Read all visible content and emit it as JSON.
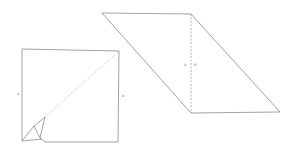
{
  "diagram": {
    "colors": {
      "stroke": "#8a8a8a",
      "dashed": "#a0a0a0",
      "background": "#ffffff"
    },
    "square": {
      "left_label": "a",
      "right_label": "a",
      "diagonal_style": "dotted",
      "folded_corner": "bottom-left"
    },
    "parallelogram": {
      "height_label_left": "a",
      "height_label_right": "b",
      "height_style": "dashed"
    }
  }
}
